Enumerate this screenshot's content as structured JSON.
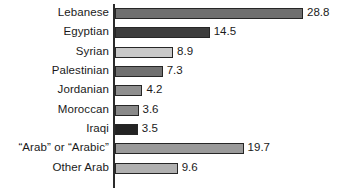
{
  "chart_data": {
    "type": "bar",
    "orientation": "horizontal",
    "title": "",
    "subtitle": "",
    "xlabel": "",
    "ylabel": "",
    "grid": false,
    "legend": false,
    "axis_range": [
      0,
      28.8
    ],
    "categories": [
      "Lebanese",
      "Egyptian",
      "Syrian",
      "Palestinian",
      "Jordanian",
      "Moroccan",
      "Iraqi",
      "“Arab” or “Arabic”",
      "Other Arab"
    ],
    "values": [
      28.8,
      14.5,
      8.9,
      7.3,
      4.2,
      3.6,
      3.5,
      19.7,
      9.6
    ],
    "value_labels": [
      "28.8",
      "14.5",
      "8.9",
      "7.3",
      "4.2",
      "3.6",
      "3.5",
      "19.7",
      "9.6"
    ],
    "bar_colors": [
      "#6f6f6f",
      "#3d3d3d",
      "#c9c9c9",
      "#707070",
      "#8f8f8f",
      "#898989",
      "#232323",
      "#9a9a9a",
      "#b0b0b0"
    ],
    "bar_outline_color": "#262626",
    "axis_color": "#2b2b2b",
    "background_color": "#ffffff",
    "text_color": "#1a1a1a"
  }
}
